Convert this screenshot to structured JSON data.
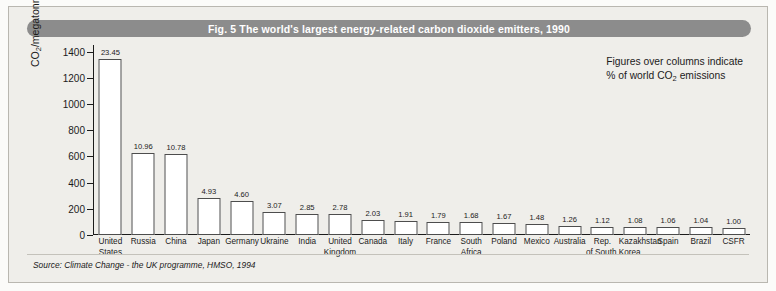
{
  "figure": {
    "title": "Fig. 5  The world's largest energy-related carbon dioxide emitters, 1990",
    "annotation_line1": "Figures over columns indicate",
    "annotation_line2_prefix": "% of world CO",
    "annotation_line2_sub": "2",
    "annotation_line2_suffix": " emissions",
    "source": "Source: Climate Change - the UK programme, HMSO, 1994",
    "colors": {
      "title_bar": "#8c8c8c",
      "title_text": "#ffffff",
      "panel_background": "#efeeea",
      "bar_fill": "#ffffff",
      "bar_stroke": "#4d4d4d",
      "axis": "#1b1b1b"
    }
  },
  "chart_data": {
    "type": "bar",
    "title": "Fig. 5  The world's largest energy-related carbon dioxide emitters, 1990",
    "xlabel": "",
    "ylabel_prefix": "CO",
    "ylabel_sub": "2",
    "ylabel_suffix": "/megatonnes of carbon",
    "ylabel": "CO2/megatonnes of carbon",
    "ylim": [
      0,
      1450
    ],
    "yticks": [
      0,
      200,
      400,
      600,
      800,
      1000,
      1200,
      1400
    ],
    "ytick_labels": [
      "0",
      "200",
      "400",
      "600",
      "800",
      "1000",
      "1200",
      "1400"
    ],
    "grid": false,
    "legend": false,
    "data_label_note": "Figures over columns indicate % of world CO2 emissions",
    "categories": [
      "United States",
      "Russia",
      "China",
      "Japan",
      "Germany",
      "Ukraine",
      "India",
      "United Kingdom",
      "Canada",
      "Italy",
      "France",
      "South Africa",
      "Poland",
      "Mexico",
      "Australia",
      "Rep. of South Korea",
      "Kazakhstan",
      "Spain",
      "Brazil",
      "CSFR"
    ],
    "category_lines": [
      [
        "United",
        "States"
      ],
      [
        "Russia",
        ""
      ],
      [
        "China",
        ""
      ],
      [
        "Japan",
        ""
      ],
      [
        "Germany",
        ""
      ],
      [
        "Ukraine",
        ""
      ],
      [
        "India",
        ""
      ],
      [
        "United",
        "Kingdom"
      ],
      [
        "Canada",
        ""
      ],
      [
        "Italy",
        ""
      ],
      [
        "France",
        ""
      ],
      [
        "South",
        "Africa"
      ],
      [
        "Poland",
        ""
      ],
      [
        "Mexico",
        ""
      ],
      [
        "Australia",
        ""
      ],
      [
        "Rep.",
        "of South Korea"
      ],
      [
        "Kazakhstan",
        ""
      ],
      [
        "Spain",
        ""
      ],
      [
        "Brazil",
        ""
      ],
      [
        "CSFR",
        ""
      ]
    ],
    "percent_labels": [
      "23.45",
      "10.96",
      "10.78",
      "4.93",
      "4.60",
      "3.07",
      "2.85",
      "2.78",
      "2.03",
      "1.91",
      "1.79",
      "1.68",
      "1.67",
      "1.48",
      "1.26",
      "1.12",
      "1.08",
      "1.06",
      "1.04",
      "1.00"
    ],
    "percent_values": [
      23.45,
      10.96,
      10.78,
      4.93,
      4.6,
      3.07,
      2.85,
      2.78,
      2.03,
      1.91,
      1.79,
      1.68,
      1.67,
      1.48,
      1.26,
      1.12,
      1.08,
      1.06,
      1.04,
      1.0
    ],
    "values": [
      1340,
      626,
      616,
      282,
      263,
      175,
      163,
      159,
      116,
      109,
      102,
      96,
      95,
      85,
      72,
      64,
      62,
      61,
      59,
      57
    ],
    "value_units": "megatonnes of carbon"
  }
}
